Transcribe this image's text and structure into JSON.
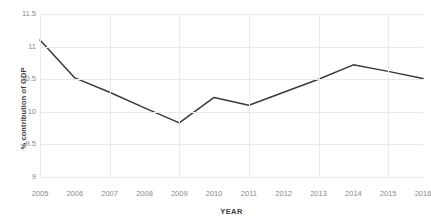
{
  "chart_data": {
    "type": "line",
    "title": "",
    "subtitle": "",
    "xlabel": "YEAR",
    "ylabel": "% contribution of GDP",
    "categories": [
      "2005",
      "2006",
      "2007",
      "2008",
      "2009",
      "2010",
      "2011",
      "2012",
      "2013",
      "2014",
      "2015",
      "2016"
    ],
    "x": [
      2005,
      2006,
      2007,
      2008,
      2009,
      2010,
      2011,
      2012,
      2013,
      2014,
      2015,
      2016
    ],
    "values": [
      11.1,
      10.52,
      10.3,
      10.06,
      9.83,
      10.22,
      10.1,
      10.3,
      10.5,
      10.72,
      10.62,
      10.51
    ],
    "series": [
      {
        "name": "% contribution of GDP",
        "values": [
          11.1,
          10.52,
          10.3,
          10.06,
          9.83,
          10.22,
          10.1,
          10.3,
          10.5,
          10.72,
          10.62,
          10.51
        ]
      }
    ],
    "ylim": [
      9,
      11.5
    ],
    "yticks": [
      11.5,
      11,
      10.5,
      10,
      9.5,
      9
    ],
    "ytick_labels": [
      "11.5",
      "11",
      "10.5",
      "10",
      "9.5",
      "9"
    ],
    "xlim": [
      2005,
      2016
    ],
    "grid": true,
    "grid_color": "#e9e9ed",
    "legend": false,
    "legend_position": "none",
    "line_color": "#3a3a3a",
    "line_width": 1.5,
    "markers": false,
    "background_color": "#ffffff",
    "tick_label_color": "#8a8a8a",
    "axis_title_color": "#3d3d3d"
  }
}
